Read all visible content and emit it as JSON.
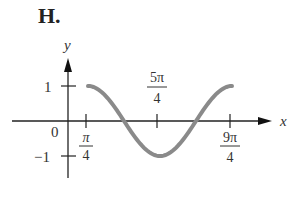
{
  "figure_label": "H.",
  "chart_data": {
    "type": "line",
    "title": "H.",
    "xlabel": "x",
    "ylabel": "y",
    "function_description": "cosine curve with period 2π, max 1 at x=π/4, min −1 at x=5π/4, max 1 at x=9π/4",
    "x_ticks": [
      "π/4",
      "5π/4",
      "9π/4"
    ],
    "y_ticks": [
      "1",
      "−1"
    ],
    "origin_label": "0",
    "x": [
      "π/4",
      "3π/4",
      "5π/4",
      "7π/4",
      "9π/4"
    ],
    "values": [
      1,
      0,
      -1,
      0,
      1
    ],
    "ylim": [
      -1,
      1
    ],
    "grid": false,
    "curve_color": "#8a8a8a"
  },
  "labels": {
    "y_axis": "y",
    "x_axis": "x",
    "y_one": "1",
    "y_neg_one": "−1",
    "origin": "0",
    "tick1_num": "π",
    "tick1_den": "4",
    "tick2_num": "5π",
    "tick2_den": "4",
    "tick3_num": "9π",
    "tick3_den": "4"
  }
}
